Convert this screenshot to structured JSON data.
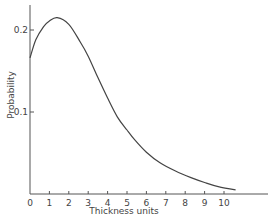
{
  "chart_data": {
    "type": "line",
    "title": "",
    "xlabel": "Thickness units",
    "ylabel": "Probability",
    "xlim": [
      0,
      12.5
    ],
    "ylim": [
      0,
      0.23
    ],
    "x_ticks": [
      0,
      1,
      2,
      3,
      4,
      5,
      6,
      7,
      8,
      9,
      10
    ],
    "x_tick_labels": [
      "0",
      "1",
      "2",
      "3",
      "4",
      "5",
      "6",
      "7",
      "8",
      "9",
      "10"
    ],
    "y_ticks": [
      0.1,
      0.2
    ],
    "y_tick_labels": [
      "0.1",
      "0.2"
    ],
    "grid": false,
    "legend": null,
    "series": [
      {
        "name": "Probability",
        "x": [
          0,
          0.3,
          0.7,
          1.0,
          1.4,
          2.0,
          2.6,
          3.0,
          3.5,
          4.0,
          4.5,
          5.0,
          5.4,
          6.0,
          6.7,
          7.5,
          8.3,
          9.0,
          9.7,
          10.6
        ],
        "values": [
          0.166,
          0.188,
          0.204,
          0.211,
          0.215,
          0.207,
          0.185,
          0.168,
          0.142,
          0.117,
          0.094,
          0.078,
          0.066,
          0.051,
          0.038,
          0.028,
          0.02,
          0.014,
          0.009,
          0.005
        ]
      }
    ]
  }
}
